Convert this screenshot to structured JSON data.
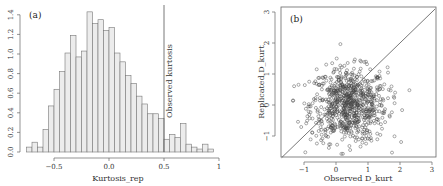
{
  "chart_data": [
    {
      "type": "bar",
      "panel": "(a)",
      "title": "",
      "xlabel": "Kurtosis_rep",
      "ylabel": "",
      "bin_width": 0.05,
      "bin_start": -0.75,
      "values": [
        0.05,
        0.1,
        0.05,
        0.23,
        0.47,
        0.64,
        0.82,
        1.01,
        1.19,
        0.97,
        1.03,
        1.43,
        1.31,
        1.35,
        1.24,
        1.27,
        1.01,
        0.92,
        0.78,
        0.7,
        0.57,
        0.49,
        0.39,
        0.39,
        0.34,
        0.13,
        0.18,
        0.15,
        0.29,
        0.08,
        0.05,
        0.03,
        0.08,
        0.03
      ],
      "xticks": [
        "-0.5",
        "0.0",
        "0.5",
        "1"
      ],
      "yticks": [
        "0.0",
        "0.2",
        "0.4",
        "0.6",
        "0.8",
        "1.0",
        "1.2",
        "1.4"
      ],
      "xlim": [
        -0.77,
        1.0
      ],
      "ylim": [
        0,
        1.45
      ],
      "vline": {
        "x": 0.5,
        "label": "Observed kurtosis"
      },
      "grid": false
    },
    {
      "type": "scatter",
      "panel": "(b)",
      "title": "",
      "xlabel": "Observed D_kurt",
      "ylabel": "Replicated D_kurt",
      "xticks": [
        "-1",
        "0",
        "1",
        "2",
        "3"
      ],
      "yticks": [
        "-1",
        "0",
        "1",
        "2",
        "3"
      ],
      "xlim": [
        -1.7,
        3.1
      ],
      "ylim": [
        -1.7,
        3.2
      ],
      "reference_line": "y = x",
      "grid": false,
      "approx_points": 800,
      "point_cloud": {
        "center_x": 0.4,
        "center_y": 0.0,
        "sd_x": 0.6,
        "sd_y": 0.6
      }
    }
  ]
}
